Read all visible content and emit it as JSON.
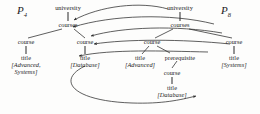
{
  "figure": {
    "type": "tree-pattern-mapping",
    "background": "#fdfdfc",
    "ink": "#2b2b2b",
    "width": 260,
    "height": 114
  },
  "patterns": [
    {
      "id": "p4",
      "label": "P",
      "subscript": "4",
      "x": 22,
      "y": 6
    },
    {
      "id": "p8",
      "label": "P",
      "subscript": "8",
      "x": 226,
      "y": 6
    }
  ],
  "nodes": {
    "left_university": {
      "text": "university",
      "x": 68,
      "y": 5
    },
    "left_courses": {
      "text": "courses",
      "x": 68,
      "y": 22
    },
    "left_course_a": {
      "text": "course",
      "x": 26,
      "y": 39
    },
    "left_title_a": {
      "text": "title",
      "x": 26,
      "y": 55
    },
    "left_value_a": {
      "text": "[Advanced, Systems]",
      "x": 26,
      "y": 62
    },
    "left_course_b": {
      "text": "course",
      "x": 85,
      "y": 39
    },
    "left_title_b": {
      "text": "title",
      "x": 85,
      "y": 55
    },
    "left_value_b": {
      "text": "[Database]",
      "x": 85,
      "y": 62
    },
    "right_university": {
      "text": "university",
      "x": 180,
      "y": 5
    },
    "right_courses": {
      "text": "courses",
      "x": 180,
      "y": 22
    },
    "right_course_a": {
      "text": "course",
      "x": 152,
      "y": 39
    },
    "right_title_a": {
      "text": "title",
      "x": 140,
      "y": 55
    },
    "right_value_a": {
      "text": "[Advanced]",
      "x": 140,
      "y": 62
    },
    "right_prereq": {
      "text": "prerequisite",
      "x": 178,
      "y": 55
    },
    "right_course_c": {
      "text": "course",
      "x": 172,
      "y": 70
    },
    "right_title_c": {
      "text": "title",
      "x": 172,
      "y": 85
    },
    "right_value_c": {
      "text": "[Database]",
      "x": 172,
      "y": 92
    },
    "right_course_b": {
      "text": "course",
      "x": 234,
      "y": 39
    },
    "right_title_b": {
      "text": "title",
      "x": 234,
      "y": 55
    },
    "right_value_b": {
      "text": "[Systems]",
      "x": 234,
      "y": 62
    }
  },
  "tree_edges": [
    {
      "name": "left-university-courses",
      "x1": 68,
      "y1": 12,
      "x2": 68,
      "y2": 21
    },
    {
      "name": "left-courses-course-a",
      "x1": 62,
      "y1": 29,
      "x2": 28,
      "y2": 38
    },
    {
      "name": "left-courses-course-b",
      "x1": 74,
      "y1": 29,
      "x2": 85,
      "y2": 38
    },
    {
      "name": "left-course-a-title",
      "x1": 26,
      "y1": 46,
      "x2": 26,
      "y2": 54
    },
    {
      "name": "left-course-b-title",
      "x1": 85,
      "y1": 46,
      "x2": 85,
      "y2": 54
    },
    {
      "name": "right-university-courses",
      "x1": 180,
      "y1": 12,
      "x2": 180,
      "y2": 21
    },
    {
      "name": "right-courses-course-a",
      "x1": 173,
      "y1": 29,
      "x2": 154,
      "y2": 38
    },
    {
      "name": "right-courses-course-b",
      "x1": 189,
      "y1": 29,
      "x2": 232,
      "y2": 38
    },
    {
      "name": "right-course-a-title",
      "x1": 149,
      "y1": 46,
      "x2": 141,
      "y2": 54
    },
    {
      "name": "right-course-a-prereq",
      "x1": 157,
      "y1": 46,
      "x2": 172,
      "y2": 53
    },
    {
      "name": "right-prereq-course",
      "x1": 176,
      "y1": 60,
      "x2": 172,
      "y2": 68
    },
    {
      "name": "right-course-c-title",
      "x1": 172,
      "y1": 77,
      "x2": 172,
      "y2": 84
    },
    {
      "name": "right-course-b-title",
      "x1": 234,
      "y1": 46,
      "x2": 234,
      "y2": 54
    }
  ],
  "mapping_arrows": [
    {
      "name": "arrow-courses-to-courses",
      "path": "M 168 9 C 140 1 100 6 73 20",
      "arrow_at": [
        73,
        20
      ]
    },
    {
      "name": "arrow-course-a-to-courses",
      "path": "M 214 24 C 170 14 110 16 72 27",
      "arrow_at": [
        72,
        27
      ]
    },
    {
      "name": "arrow-course-b-to-course-a",
      "path": "M 222 33 C 175 26 120 28 90 36",
      "arrow_at": [
        90,
        36
      ]
    },
    {
      "name": "arrow-right-to-course-b",
      "path": "M 228 44 C 180 40 125 40 93 44",
      "arrow_at": [
        93,
        44
      ]
    },
    {
      "name": "arrow-title-to-lower",
      "path": "M 205 52 C 160 52 110 50 78 56",
      "arrow_at": [
        78,
        56
      ]
    },
    {
      "name": "arrow-bottom-long",
      "path": "M 84 66 C 58 78 70 100 130 103 C 160 104 178 100 196 96",
      "arrow_at": [
        196,
        96
      ]
    }
  ]
}
